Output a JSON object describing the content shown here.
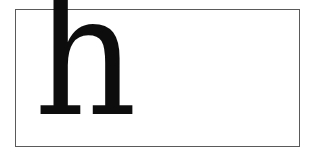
{
  "specimen": {
    "letter": "h",
    "ink_color": "#0d0d0d",
    "frame_color": "#5a5a5a",
    "background": "#ffffff"
  }
}
